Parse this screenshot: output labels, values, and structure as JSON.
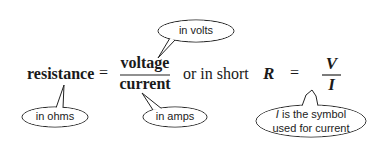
{
  "equation": {
    "lhs": "resistance",
    "equals": "=",
    "numerator": "voltage",
    "denominator": "current",
    "connector": "or in short",
    "short_lhs": "R",
    "short_equals": "=",
    "short_numerator": "V",
    "short_denominator": "I"
  },
  "callouts": {
    "volts": "in volts",
    "ohms": "in ohms",
    "amps": "in amps",
    "current_symbol_line1_italic": "I",
    "current_symbol_line1_rest": " is the symbol",
    "current_symbol_line2": "used for current"
  }
}
